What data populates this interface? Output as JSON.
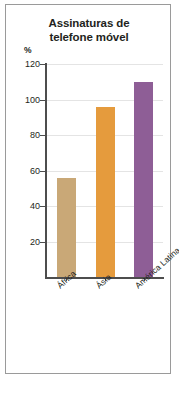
{
  "figure": {
    "title_line1": "Assinaturas de",
    "title_line2": "telefone móvel",
    "unit_label": "%",
    "frame_color": "#9a9a9a"
  },
  "chart_data": {
    "type": "bar",
    "title": "Assinaturas de telefone móvel",
    "xlabel": "",
    "ylabel": "%",
    "ylim": [
      0,
      120
    ],
    "yticks": [
      20,
      40,
      60,
      80,
      100,
      120
    ],
    "ytick_labels": [
      "20",
      "40",
      "60",
      "80",
      "100",
      "120"
    ],
    "grid": true,
    "legend": "none",
    "categories": [
      "África",
      "Ásia",
      "América Latina e Caribe"
    ],
    "values": [
      56,
      96,
      110
    ],
    "colors": [
      "#c9a877",
      "#e59b3d",
      "#8e5e96"
    ]
  }
}
